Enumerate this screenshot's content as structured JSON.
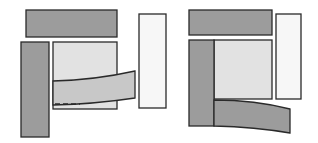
{
  "diagram": {
    "colors": {
      "dark": "#9a9a9a",
      "medium": "#c6c6c6",
      "light": "#e2e2e2",
      "pale": "#f6f6f6",
      "stroke": "#2a2a2a"
    },
    "panels": [
      {
        "name": "left-configuration",
        "shapes": [
          "top-bar",
          "left-bar",
          "center-square",
          "right-bar",
          "curved-strip-overlapping",
          "dashed-guide-line"
        ]
      },
      {
        "name": "right-configuration",
        "shapes": [
          "top-bar",
          "left-bar",
          "center-square",
          "right-bar",
          "curved-strip-below"
        ]
      }
    ]
  }
}
